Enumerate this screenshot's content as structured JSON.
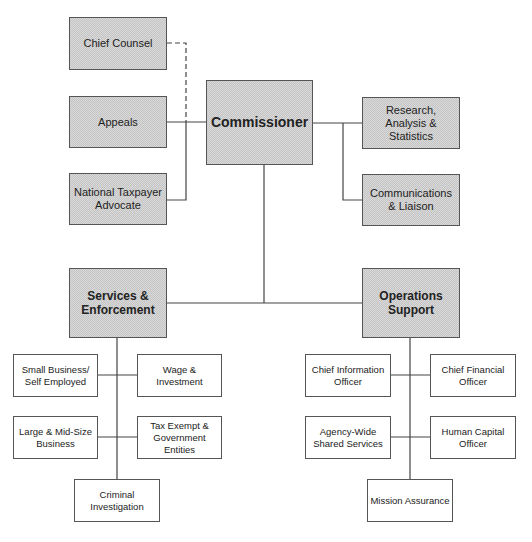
{
  "diagram": {
    "type": "org-chart",
    "top": {
      "chief_counsel": "Chief Counsel",
      "appeals": "Appeals",
      "national_taxpayer_advocate": "National Taxpayer\nAdvocate",
      "commissioner": "Commissioner",
      "research_analysis_statistics": "Research,\nAnalysis &\nStatistics",
      "communications_liaison": "Communications\n& Liaison"
    },
    "services_enforcement": {
      "title": "Services &\nEnforcement",
      "units": {
        "small_business": "Small Business/\nSelf Employed",
        "wage_investment": "Wage &\nInvestment",
        "large_midsize": "Large & Mid-Size\nBusiness",
        "tax_exempt": "Tax Exempt &\nGovernment Entities",
        "criminal_investigation": "Criminal\nInvestigation"
      }
    },
    "operations_support": {
      "title": "Operations\nSupport",
      "units": {
        "cio": "Chief Information\nOfficer",
        "cfo": "Chief Financial\nOfficer",
        "awss": "Agency-Wide\nShared Services",
        "hco": "Human Capital\nOfficer",
        "mission_assurance": "Mission Assurance"
      }
    },
    "colors": {
      "line": "#444444",
      "box_border": "#555555",
      "shade": "#d9d9d9"
    }
  }
}
